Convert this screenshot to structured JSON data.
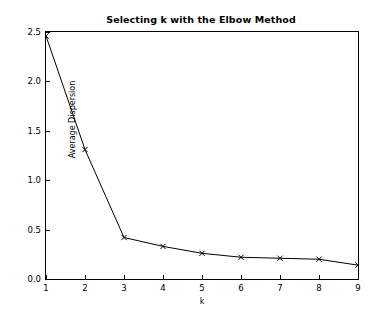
{
  "chart_data": {
    "type": "line",
    "title": "Selecting k with the Elbow Method",
    "xlabel": "k",
    "ylabel": "Average Dispersion",
    "x": [
      1,
      2,
      3,
      4,
      5,
      6,
      7,
      8,
      9
    ],
    "values": [
      2.46,
      1.31,
      0.42,
      0.33,
      0.26,
      0.22,
      0.21,
      0.2,
      0.14
    ],
    "series": [
      {
        "name": "Average Dispersion",
        "values": [
          2.46,
          1.31,
          0.42,
          0.33,
          0.26,
          0.22,
          0.21,
          0.2,
          0.14
        ]
      }
    ],
    "xlim": [
      1,
      9
    ],
    "ylim": [
      0.0,
      2.5
    ],
    "xticks": [
      1,
      2,
      3,
      4,
      5,
      6,
      7,
      8,
      9
    ],
    "xtick_labels": [
      "1",
      "2",
      "3",
      "4",
      "5",
      "6",
      "7",
      "8",
      "9"
    ],
    "yticks": [
      0.0,
      0.5,
      1.0,
      1.5,
      2.0,
      2.5
    ],
    "ytick_labels": [
      "0.0",
      "0.5",
      "1.0",
      "1.5",
      "2.0",
      "2.5"
    ],
    "grid": false,
    "legend": false,
    "legend_position": "none",
    "line_color": "#000000",
    "marker": "x",
    "background_color": "#ffffff",
    "axes_color": "#000000"
  }
}
